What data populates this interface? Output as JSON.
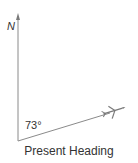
{
  "diagram": {
    "north_label": "N",
    "angle_label": "73°",
    "caption": "Present Heading",
    "heading_degrees": 73,
    "colors": {
      "line": "#8a8a8a",
      "text": "#333333",
      "aircraft": "#7a7a7a"
    },
    "icons": {
      "north_arrow": "arrow-up-icon",
      "aircraft": "airplane-icon"
    }
  }
}
